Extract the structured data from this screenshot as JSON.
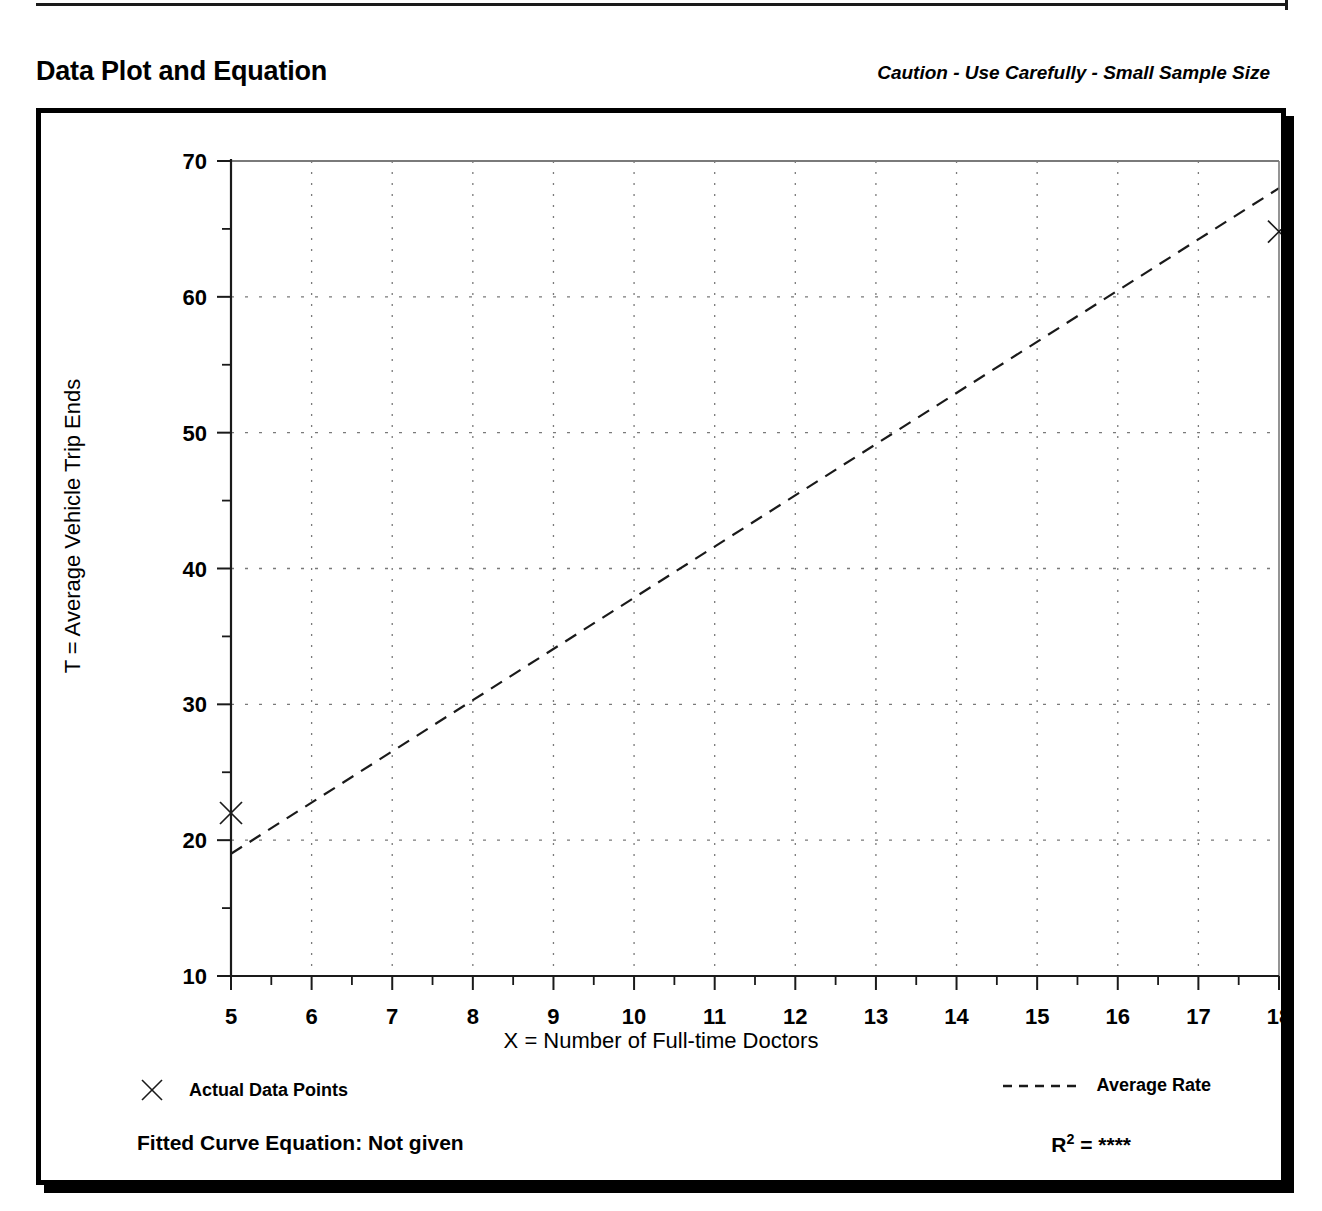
{
  "header": {
    "title": "Data Plot and Equation",
    "caution": "Caution - Use Carefully - Small Sample Size"
  },
  "legend": {
    "data_points_label": "Actual Data Points",
    "average_rate_label": "Average Rate",
    "marker_icon": "x-marker-icon",
    "line_icon": "dashed-line-icon"
  },
  "footer": {
    "equation_label": "Fitted Curve Equation:  Not given",
    "rsq_prefix": "R",
    "rsq_exponent": "2",
    "rsq_value": "= ****"
  },
  "colors": {
    "ink": "#000000",
    "grid": "#7a7a7a",
    "axis": "#1a1a1a",
    "background": "#ffffff"
  },
  "chart_data": {
    "type": "scatter",
    "title": "Data Plot and Equation",
    "xlabel": "X = Number of Full-time Doctors",
    "ylabel": "T = Average Vehicle Trip Ends",
    "xlim": [
      5,
      18
    ],
    "ylim": [
      10,
      70
    ],
    "xticks": [
      5,
      6,
      7,
      8,
      9,
      10,
      11,
      12,
      13,
      14,
      15,
      16,
      17,
      18
    ],
    "xticklabels": [
      "5",
      "6",
      "7",
      "8",
      "9",
      "10",
      "11",
      "12",
      "13",
      "14",
      "15",
      "16",
      "17",
      "18"
    ],
    "yticks": [
      10,
      20,
      30,
      40,
      50,
      60,
      70
    ],
    "yticklabels": [
      "10",
      "20",
      "30",
      "40",
      "50",
      "60",
      "70"
    ],
    "y_minor_ticks": [
      15,
      25,
      35,
      45,
      55,
      65
    ],
    "x_minor_ticks": [
      5.5,
      6.5,
      7.5,
      8.5,
      9.5,
      10.5,
      11.5,
      12.5,
      13.5,
      14.5,
      15.5,
      16.5,
      17.5
    ],
    "grid": true,
    "grid_style": "dotted",
    "legend_position": "below-axes",
    "series": [
      {
        "name": "Actual Data Points",
        "type": "scatter",
        "marker": "x",
        "points": [
          {
            "x": 5,
            "y": 22.0
          },
          {
            "x": 18,
            "y": 64.8
          }
        ]
      },
      {
        "name": "Average Rate",
        "type": "line",
        "linestyle": "dashed",
        "points": [
          {
            "x": 5,
            "y": 19.0
          },
          {
            "x": 18,
            "y": 68.0
          }
        ]
      }
    ]
  }
}
